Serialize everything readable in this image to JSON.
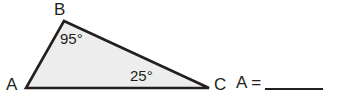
{
  "figure": {
    "shape": "triangle",
    "fill_color": "#ededed",
    "stroke_color": "#231f20",
    "vertices": [
      {
        "name": "A",
        "label": "A",
        "x": 26,
        "y": 88
      },
      {
        "name": "B",
        "label": "B",
        "x": 64,
        "y": 21
      },
      {
        "name": "C",
        "label": "C",
        "x": 209,
        "y": 88
      }
    ],
    "angle_labels": [
      {
        "at_vertex": "B",
        "label": "95°",
        "value": 95
      },
      {
        "at_vertex": "C",
        "label": "25°",
        "value": 25
      }
    ]
  },
  "answer": {
    "variable": "A",
    "equals": "=",
    "value": ""
  }
}
